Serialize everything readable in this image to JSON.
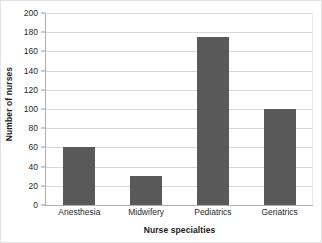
{
  "chart_data": {
    "type": "bar",
    "title": "",
    "categories": [
      "Anesthesia",
      "Midwifery",
      "Pediatrics",
      "Geriatrics"
    ],
    "values": [
      60,
      30,
      175,
      100
    ],
    "xlabel": "Nurse specialties",
    "ylabel": "Number of nurses",
    "ylim": [
      0,
      200
    ],
    "ytick_step": 20,
    "yticks": [
      0,
      20,
      40,
      60,
      80,
      100,
      120,
      140,
      160,
      180,
      200
    ],
    "ytick_labels": [
      "0",
      "20",
      "40",
      "60",
      "80",
      "100",
      "120",
      "140",
      "160",
      "180",
      "200"
    ],
    "grid": "horizontal",
    "legend": "none",
    "bar_color": "#595959",
    "gridline_color": "#d8d8d8",
    "axis_color": "#b0b0b0",
    "background_color": "#ffffff",
    "border_color": "#e3e3e3"
  }
}
